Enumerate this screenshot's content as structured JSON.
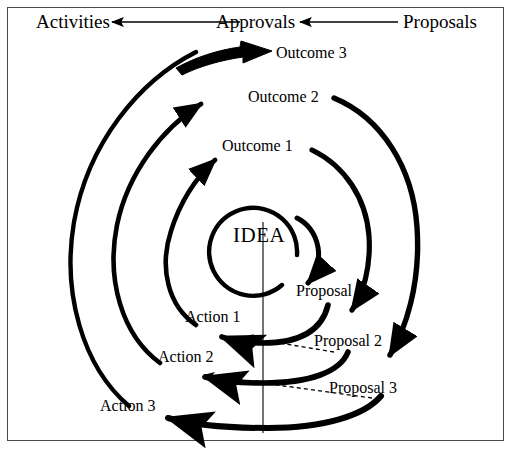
{
  "figure": {
    "kind": "spiral-process-diagram",
    "background_color": "#ffffff",
    "ink_color": "#000000",
    "border_color": "#4a4a4a",
    "center_label": "IDEA"
  },
  "header_flow": {
    "nodes": [
      "Activities",
      "Approvals",
      "Proposals"
    ],
    "arrows": [
      {
        "from": "Proposals",
        "to": "Approvals",
        "style": "solid-thin",
        "direction": "left"
      },
      {
        "from": "Approvals",
        "to": "Activities",
        "style": "solid-thin",
        "direction": "left"
      }
    ],
    "labels": {
      "activities": "Activities",
      "approvals": "Approvals",
      "proposals": "Proposals"
    }
  },
  "cycles": [
    {
      "index": 1,
      "proposal": "Proposal 1",
      "action": "Action 1",
      "outcome": "Outcome 1"
    },
    {
      "index": 2,
      "proposal": "Proposal 2",
      "action": "Action 2",
      "outcome": "Outcome 2"
    },
    {
      "index": 3,
      "proposal": "Proposal 3",
      "action": "Action 3",
      "outcome": "Outcome 3"
    }
  ],
  "labels": {
    "idea": "IDEA",
    "proposal_1": "Proposal 1",
    "proposal_2": "Proposal 2",
    "proposal_3": "Proposal 3",
    "action_1": "Action 1",
    "action_2": "Action 2",
    "action_3": "Action 3",
    "outcome_1": "Outcome 1",
    "outcome_2": "Outcome 2",
    "outcome_3": "Outcome 3"
  },
  "dashed_links": [
    {
      "from": "Proposal 2",
      "to": "Action 1"
    },
    {
      "from": "Proposal 3",
      "to": "Action 2"
    }
  ],
  "axis": {
    "vertical_line": "center reference line from IDEA downward"
  }
}
